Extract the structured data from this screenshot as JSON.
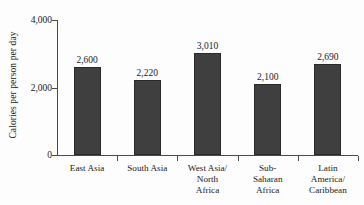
{
  "chart_data": {
    "type": "bar",
    "title": "",
    "subtitle": "",
    "xlabel": "",
    "ylabel": "Calories per person per day",
    "categories": [
      "East Asia",
      "South Asia",
      "West Asia/\nNorth\nAfrica",
      "Sub-\nSaharan\nAfrica",
      "Latin\nAmerica/\nCaribbean"
    ],
    "values": [
      2600,
      2220,
      3010,
      2100,
      2690
    ],
    "value_labels": [
      "2,600",
      "2,220",
      "3,010",
      "2,100",
      "2,690"
    ],
    "ylim": [
      0,
      4000
    ],
    "ytick_values": [
      0,
      2000,
      4000
    ],
    "ytick_labels": [
      "0",
      "2,000",
      "4,000"
    ],
    "grid": false,
    "legend": false,
    "legend_position": "none",
    "bar_color": "#3f3f3f",
    "axis_color": "#4a4a4a",
    "background_color": "#fdfdfd",
    "annotations": []
  }
}
